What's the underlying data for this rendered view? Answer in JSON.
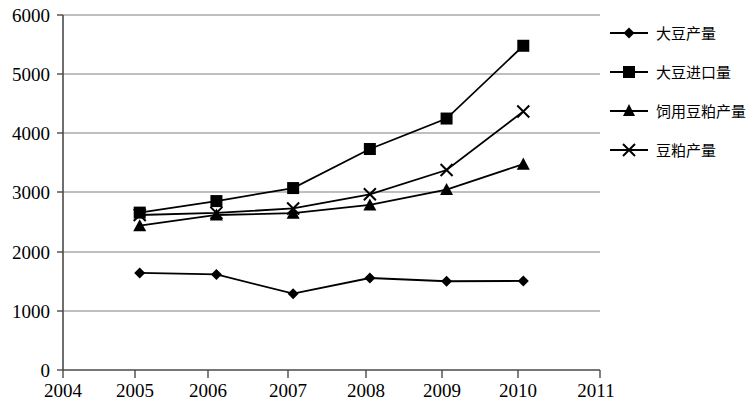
{
  "chart_data": {
    "type": "line",
    "title": "",
    "subtitle": "",
    "xlabel": "",
    "ylabel": "",
    "xlim": [
      2004,
      2011
    ],
    "ylim": [
      0,
      6000
    ],
    "x_ticks": [
      "2004",
      "2005",
      "2006",
      "2007",
      "2008",
      "2009",
      "2010",
      "2011"
    ],
    "y_ticks": [
      "0",
      "1000",
      "2000",
      "3000",
      "4000",
      "5000",
      "6000"
    ],
    "grid": "horizontal",
    "legend_position": "right",
    "x": [
      2005,
      2006,
      2007,
      2008,
      2009,
      2010
    ],
    "series": [
      {
        "name": "大豆产量",
        "marker": "diamond",
        "color": "#000000",
        "values": [
          1640,
          1615,
          1290,
          1555,
          1500,
          1505
        ]
      },
      {
        "name": "大豆进口量",
        "marker": "square",
        "color": "#000000",
        "values": [
          2660,
          2855,
          3075,
          3735,
          4250,
          5480
        ]
      },
      {
        "name": "饲用豆粕产量",
        "marker": "triangle",
        "color": "#000000",
        "values": [
          2440,
          2620,
          2650,
          2790,
          3050,
          3480
        ]
      },
      {
        "name": "豆粕产量",
        "marker": "x",
        "color": "#000000",
        "values": [
          2620,
          2655,
          2730,
          2970,
          3380,
          4370
        ]
      }
    ]
  },
  "axes": {
    "y_tick_0": "0",
    "y_tick_1": "1000",
    "y_tick_2": "2000",
    "y_tick_3": "3000",
    "y_tick_4": "4000",
    "y_tick_5": "5000",
    "y_tick_6": "6000",
    "x_tick_0": "2004",
    "x_tick_1": "2005",
    "x_tick_2": "2006",
    "x_tick_3": "2007",
    "x_tick_4": "2008",
    "x_tick_5": "2009",
    "x_tick_6": "2010",
    "x_tick_7": "2011"
  },
  "legend": {
    "item_0": "大豆产量",
    "item_1": "大豆进口量",
    "item_2": "饲用豆粕产量",
    "item_3": "豆粕产量"
  },
  "colors": {
    "line": "#000000",
    "grid": "#808080",
    "axis": "#000000",
    "background": "#ffffff"
  }
}
